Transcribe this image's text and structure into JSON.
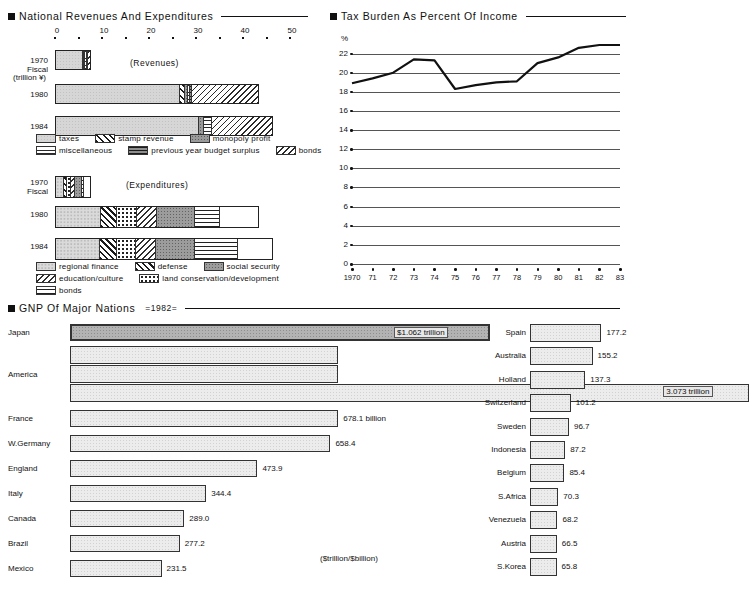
{
  "page": {
    "background": "#ffffff",
    "ink": "#111111"
  },
  "panel_revenue": {
    "title": "National Revenues And Expenditures",
    "bullet_icon": "filled-square-bullet",
    "axis": {
      "unit_label": "(trillion ¥)",
      "labels": [
        "0",
        "10",
        "20",
        "30",
        "40",
        "50"
      ],
      "values": [
        0,
        10,
        20,
        30,
        40,
        50
      ],
      "min": 0,
      "max": 50,
      "minor_step": 5
    },
    "revenues_caption": "(Revenues)",
    "expenditures_caption": "(Expenditures)",
    "row_labels": [
      {
        "year": "1970",
        "sub": "Fiscal"
      },
      {
        "year": "1980",
        "sub": ""
      },
      {
        "year": "1984",
        "sub": ""
      }
    ],
    "revenue_legend": [
      {
        "key": "taxes",
        "label": "taxes"
      },
      {
        "key": "stamp",
        "label": "stamp revenue"
      },
      {
        "key": "monopoly",
        "label": "monopoly profit"
      },
      {
        "key": "misc",
        "label": "miscellaneous"
      },
      {
        "key": "prevsurp",
        "label": "previous year budget surplus"
      },
      {
        "key": "bonds",
        "label": "bonds"
      }
    ],
    "expenditure_legend": [
      {
        "key": "region",
        "label": "regional finance"
      },
      {
        "key": "defense",
        "label": "defense"
      },
      {
        "key": "social",
        "label": "social security"
      },
      {
        "key": "edu",
        "label": "education/culture"
      },
      {
        "key": "land",
        "label": "land conservation/development"
      },
      {
        "key": "bonds",
        "label": "bonds"
      }
    ]
  },
  "chart_data": [
    {
      "type": "bar",
      "id": "national-revenues",
      "title": "National Revenues And Expenditures",
      "subtitle": "(Revenues)",
      "orientation": "horizontal",
      "stacked": true,
      "xlabel": "(trillion ¥)",
      "ylabel": "",
      "xlim": [
        0,
        50
      ],
      "categories": [
        "1970",
        "1980",
        "1984"
      ],
      "series": [
        {
          "name": "taxes",
          "values": [
            6.0,
            26.6,
            30.8
          ]
        },
        {
          "name": "stamp revenue",
          "values": [
            0.3,
            1.2,
            0.0
          ]
        },
        {
          "name": "monopoly profit",
          "values": [
            0.3,
            0.5,
            0.9
          ]
        },
        {
          "name": "miscellaneous",
          "values": [
            0.5,
            0.6,
            1.9
          ]
        },
        {
          "name": "previous year budget surplus",
          "values": [
            0.2,
            0.4,
            0.0
          ]
        },
        {
          "name": "bonds",
          "values": [
            0.4,
            14.2,
            12.8
          ]
        }
      ],
      "totals": [
        7.7,
        43.5,
        46.4
      ]
    },
    {
      "type": "bar",
      "id": "national-expenditures",
      "title": "National Revenues And Expenditures",
      "subtitle": "(Expenditures)",
      "orientation": "horizontal",
      "stacked": true,
      "xlabel": "(trillion ¥)",
      "xlim": [
        0,
        50
      ],
      "categories": [
        "1970",
        "1980",
        "1984"
      ],
      "series": [
        {
          "name": "regional finance",
          "values": [
            1.8,
            9.7,
            9.5
          ]
        },
        {
          "name": "defense",
          "values": [
            0.7,
            3.5,
            3.5
          ]
        },
        {
          "name": "land conservation/development",
          "values": [
            0.9,
            4.1,
            4.2
          ]
        },
        {
          "name": "education/culture",
          "values": [
            0.9,
            4.3,
            4.2
          ]
        },
        {
          "name": "social security",
          "values": [
            1.6,
            8.3,
            8.4
          ]
        },
        {
          "name": "bonds",
          "values": [
            0.4,
            5.3,
            9.2
          ]
        },
        {
          "name": "other",
          "values": [
            1.4,
            8.3,
            7.4
          ]
        }
      ],
      "totals": [
        7.7,
        43.5,
        46.4
      ]
    },
    {
      "type": "line",
      "id": "tax-burden",
      "title": "Tax Burden As Percent Of Income",
      "ylabel": "%",
      "ylim": [
        0,
        23
      ],
      "yticks": [
        0,
        2,
        4,
        6,
        8,
        10,
        12,
        14,
        16,
        18,
        20,
        22
      ],
      "grid": true,
      "x": [
        "1970",
        "71",
        "72",
        "73",
        "74",
        "75",
        "76",
        "77",
        "78",
        "79",
        "80",
        "81",
        "82",
        "83"
      ],
      "series": [
        {
          "name": "Tax burden",
          "values": [
            18.9,
            19.4,
            20.0,
            21.4,
            21.3,
            18.3,
            18.7,
            19.0,
            19.1,
            21.0,
            21.6,
            22.6,
            22.9,
            22.9
          ]
        }
      ]
    },
    {
      "type": "bar",
      "id": "gnp-major-nations",
      "title": "GNP Of Major Nations",
      "subtitle": "=1982=",
      "orientation": "horizontal",
      "unit_note": "($trillion/$billion)",
      "categories": [
        "Japan",
        "America",
        "France",
        "W.Germany",
        "England",
        "Italy",
        "Canada",
        "Brazil",
        "Mexico",
        "Spain",
        "Australia",
        "Holland",
        "Switzerland",
        "Sweden",
        "Indonesia",
        "Belgium",
        "S.Africa",
        "Venezuela",
        "Austria",
        "S.Korea"
      ],
      "values": [
        1062.0,
        3073.0,
        678.1,
        658.4,
        473.9,
        344.4,
        289.0,
        277.2,
        231.5,
        177.2,
        155.2,
        137.3,
        101.2,
        96.7,
        87.2,
        85.4,
        70.3,
        68.2,
        66.5,
        65.8
      ],
      "value_labels": [
        "$1.062 trillion",
        "3.073 trillion",
        "678.1 billion",
        "658.4",
        "473.9",
        "344.4",
        "289.0",
        "277.2",
        "231.5",
        "177.2",
        "155.2",
        "137.3",
        "101.2",
        "96.7",
        "87.2",
        "85.4",
        "70.3",
        "68.2",
        "66.5",
        "65.8"
      ]
    }
  ],
  "panel_tax": {
    "title": "Tax Burden As Percent Of Income",
    "bullet_icon": "filled-square-bullet",
    "unit": "%",
    "yticks": [
      "22",
      "20",
      "18",
      "16",
      "14",
      "12",
      "10",
      "8",
      "6",
      "4",
      "2",
      "0"
    ],
    "xticks": [
      "1970",
      "71",
      "72",
      "73",
      "74",
      "75",
      "76",
      "77",
      "78",
      "79",
      "80",
      "81",
      "82",
      "83"
    ]
  },
  "panel_gnp": {
    "title": "GNP Of Major Nations",
    "bullet_icon": "filled-square-bullet",
    "year_tag": "=1982=",
    "unit_note": "($trillion/$billion)",
    "left": [
      {
        "name": "Japan",
        "label": "$1.062 trillion",
        "inside": true
      },
      {
        "name": "America",
        "label": "3.073 trillion",
        "inside": true
      },
      {
        "name": "France",
        "label": "678.1 billion",
        "inside": false
      },
      {
        "name": "W.Germany",
        "label": "658.4",
        "inside": false
      },
      {
        "name": "England",
        "label": "473.9",
        "inside": false
      },
      {
        "name": "Italy",
        "label": "344.4",
        "inside": false
      },
      {
        "name": "Canada",
        "label": "289.0",
        "inside": false
      },
      {
        "name": "Brazil",
        "label": "277.2",
        "inside": false
      },
      {
        "name": "Mexico",
        "label": "231.5",
        "inside": false
      }
    ],
    "right": [
      {
        "name": "Spain",
        "label": "177.2"
      },
      {
        "name": "Australia",
        "label": "155.2"
      },
      {
        "name": "Holland",
        "label": "137.3"
      },
      {
        "name": "Switzerland",
        "label": "101.2"
      },
      {
        "name": "Sweden",
        "label": "96.7"
      },
      {
        "name": "Indonesia",
        "label": "87.2"
      },
      {
        "name": "Belgium",
        "label": "85.4"
      },
      {
        "name": "S.Africa",
        "label": "70.3"
      },
      {
        "name": "Venezuela",
        "label": "68.2"
      },
      {
        "name": "Austria",
        "label": "66.5"
      },
      {
        "name": "S.Korea",
        "label": "65.8"
      }
    ]
  }
}
